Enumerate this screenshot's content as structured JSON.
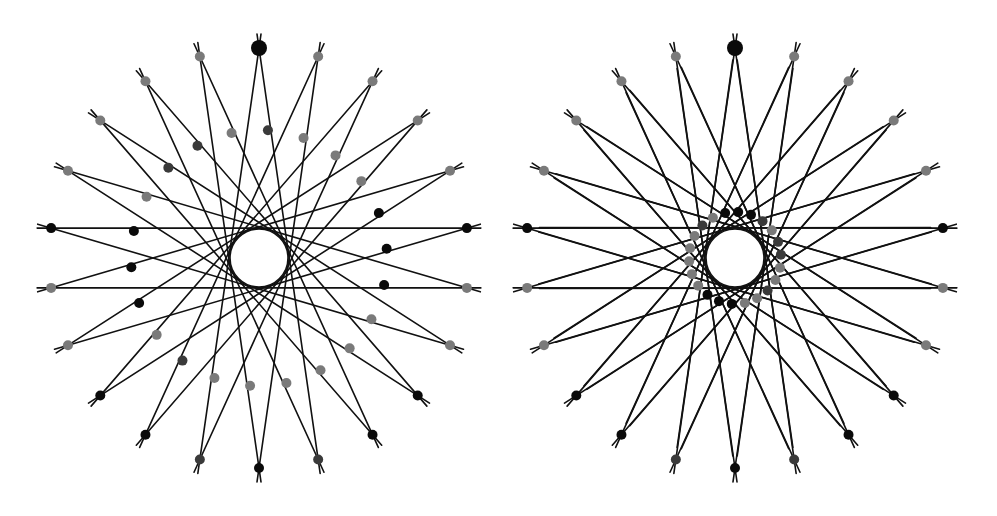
{
  "figure": {
    "width": 997,
    "height": 516,
    "background": "#ffffff",
    "line_color": "#111111",
    "colors": {
      "black": "#0a0a0a",
      "gray": "#7a7a7a",
      "dark": "#3a3a3a"
    },
    "diagrams": [
      {
        "name": "left-diagram",
        "mode": "chord",
        "center": [
          259,
          258
        ],
        "outer_radius": 210,
        "inner_circle_radius": 29,
        "point_count": 22,
        "chord_skip": 10,
        "overshoot": 14,
        "top_point_radius": 8,
        "point_radius": 5,
        "outer_point_colors": [
          "black",
          "gray",
          "gray",
          "gray",
          "gray",
          "black",
          "gray",
          "gray",
          "black",
          "black",
          "dark",
          "black",
          "dark",
          "black",
          "black",
          "gray",
          "gray",
          "black",
          "gray",
          "gray",
          "gray",
          "gray"
        ],
        "marker_ring_radius": 128,
        "marker_count": 22,
        "marker_offset_deg": 4,
        "marker_radius": 5,
        "marker_colors": [
          "dark",
          "gray",
          "gray",
          "gray",
          "black",
          "black",
          "black",
          "gray",
          "gray",
          "gray",
          "gray",
          "gray",
          "gray",
          "dark",
          "gray",
          "black",
          "black",
          "black",
          "gray",
          "dark",
          "dark",
          "gray"
        ]
      },
      {
        "name": "right-diagram",
        "mode": "fan",
        "center": [
          735,
          258
        ],
        "outer_radius": 210,
        "inner_circle_radius": 29,
        "point_count": 22,
        "far_radius": 198,
        "far_spread_deg": 17,
        "overshoot": 14,
        "top_point_radius": 8,
        "point_radius": 5,
        "outer_point_colors": [
          "black",
          "gray",
          "gray",
          "gray",
          "gray",
          "black",
          "gray",
          "gray",
          "black",
          "black",
          "dark",
          "black",
          "dark",
          "black",
          "black",
          "gray",
          "gray",
          "black",
          "gray",
          "gray",
          "gray",
          "gray"
        ],
        "marker_ring_radius": 46,
        "marker_count": 22,
        "marker_offset_deg": 4,
        "marker_radius": 5,
        "marker_colors": [
          "black",
          "black",
          "dark",
          "gray",
          "dark",
          "dark",
          "gray",
          "gray",
          "dark",
          "gray",
          "gray",
          "black",
          "black",
          "black",
          "gray",
          "gray",
          "gray",
          "gray",
          "gray",
          "dark",
          "gray",
          "black"
        ]
      }
    ]
  }
}
